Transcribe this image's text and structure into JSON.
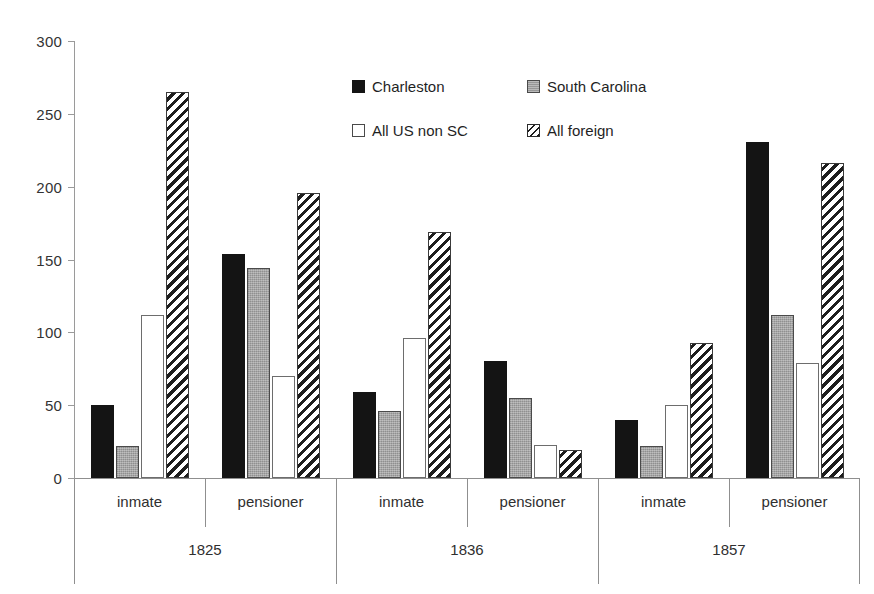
{
  "chart_data": {
    "type": "bar",
    "title": "",
    "xlabel": "",
    "ylabel": "",
    "ylim": [
      0,
      300
    ],
    "yticks": [
      0,
      50,
      100,
      150,
      200,
      250,
      300
    ],
    "grid": false,
    "legend_position": "top-center",
    "group_labels": [
      "1825",
      "1836",
      "1857"
    ],
    "categories": [
      "1825 inmate",
      "1825 pensioner",
      "1836 inmate",
      "1836 pensioner",
      "1857 inmate",
      "1857 pensioner"
    ],
    "subcategories": [
      "inmate",
      "pensioner",
      "inmate",
      "pensioner",
      "inmate",
      "pensioner"
    ],
    "series": [
      {
        "name": "Charleston",
        "pattern": "solid-black",
        "color": "#141414",
        "values": [
          50,
          154,
          59,
          80,
          40,
          231
        ]
      },
      {
        "name": "South Carolina",
        "pattern": "gray-fill",
        "color": "#a3a3a3",
        "values": [
          22,
          144,
          46,
          55,
          22,
          112
        ]
      },
      {
        "name": "All US non SC",
        "pattern": "white-fill",
        "color": "#ffffff",
        "values": [
          112,
          70,
          96,
          23,
          50,
          79
        ]
      },
      {
        "name": "All foreign",
        "pattern": "diagonal-hatch",
        "color": "#1d1d1d",
        "values": [
          265,
          196,
          169,
          19,
          93,
          216
        ]
      }
    ]
  },
  "legend": {
    "items": [
      {
        "label": "Charleston"
      },
      {
        "label": "South Carolina"
      },
      {
        "label": "All US non SC"
      },
      {
        "label": "All foreign"
      }
    ]
  },
  "axis": {
    "y_tick_labels": [
      "300",
      "250",
      "200",
      "150",
      "100",
      "50",
      "0"
    ]
  }
}
